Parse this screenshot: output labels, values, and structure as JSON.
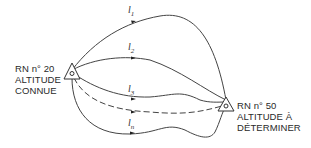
{
  "diagram": {
    "type": "leveling-network",
    "start_point": {
      "line1": "RN n° 20",
      "line2": "ALTITUDE",
      "line3": "CONNUE"
    },
    "end_point": {
      "line1": "RN n° 50",
      "line2": "ALTITUDE À",
      "line3": "DÉTERMINER"
    },
    "paths": [
      {
        "base": "l",
        "sub": "1",
        "style": "solid"
      },
      {
        "base": "l",
        "sub": "2",
        "style": "solid"
      },
      {
        "base": "l",
        "sub": "3",
        "style": "solid"
      },
      {
        "base": "",
        "sub": "",
        "style": "dashed"
      },
      {
        "base": "l",
        "sub": "n",
        "style": "solid"
      }
    ],
    "colors": {
      "line": "#444444",
      "text": "#2a2a2a"
    }
  }
}
